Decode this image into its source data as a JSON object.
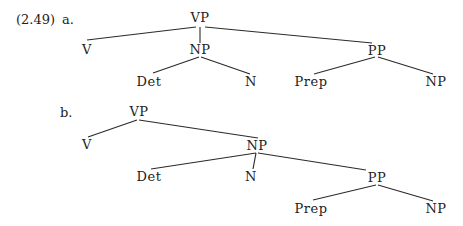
{
  "example_number": "(2.49)",
  "trees": [
    {
      "label": "a.",
      "nodes": {
        "root": "VP",
        "v": "V",
        "np": "NP",
        "pp": "PP",
        "det": "Det",
        "n": "N",
        "prep": "Prep",
        "np2": "NP"
      },
      "structure": "[VP V [NP Det N] [PP Prep NP]]"
    },
    {
      "label": "b.",
      "nodes": {
        "root": "VP",
        "v": "V",
        "np": "NP",
        "det": "Det",
        "n": "N",
        "pp": "PP",
        "prep": "Prep",
        "np2": "NP"
      },
      "structure": "[VP V [NP Det N [PP Prep NP]]]"
    }
  ]
}
